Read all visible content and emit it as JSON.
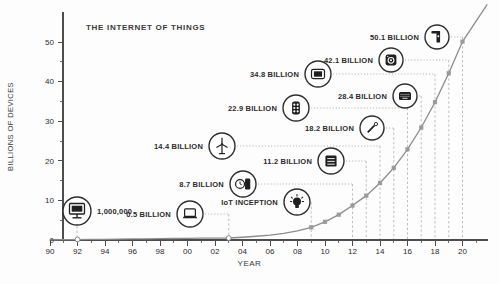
{
  "chart_data": {
    "type": "line",
    "title": "THE INTERNET OF THINGS",
    "xlabel": "YEAR",
    "ylabel": "BILLIONS OF DEVICES",
    "x_tick_years": [
      1990,
      1992,
      1994,
      1996,
      1998,
      2000,
      2002,
      2004,
      2006,
      2008,
      2010,
      2012,
      2014,
      2016,
      2018,
      2020
    ],
    "x_tick_labels": [
      "90",
      "92",
      "94",
      "96",
      "98",
      "00",
      "02",
      "04",
      "06",
      "08",
      "10",
      "12",
      "14",
      "16",
      "18",
      "20"
    ],
    "x_minor_years": [
      1991,
      1993,
      1995,
      1997,
      1999,
      2001,
      2003,
      2005,
      2007,
      2009,
      2011,
      2013,
      2015,
      2017,
      2019,
      2021
    ],
    "y_ticks": [
      0,
      10,
      20,
      30,
      40,
      50
    ],
    "y_minor_ticks": [
      5,
      15,
      25,
      35,
      45
    ],
    "xlim": [
      1990,
      2021.8
    ],
    "ylim": [
      0,
      59
    ],
    "grid": "dashed verticals at annotated years only",
    "legend": "none",
    "series": [
      {
        "name": "connected devices (billions)",
        "points": [
          [
            1990,
            0.05
          ],
          [
            1991,
            0.08
          ],
          [
            1992,
            0.1
          ],
          [
            1993,
            0.14
          ],
          [
            1994,
            0.18
          ],
          [
            1995,
            0.22
          ],
          [
            1996,
            0.26
          ],
          [
            1997,
            0.3
          ],
          [
            1998,
            0.34
          ],
          [
            1999,
            0.38
          ],
          [
            2000,
            0.42
          ],
          [
            2001,
            0.45
          ],
          [
            2002,
            0.48
          ],
          [
            2003,
            0.5
          ],
          [
            2004,
            0.7
          ],
          [
            2005,
            0.95
          ],
          [
            2006,
            1.25
          ],
          [
            2007,
            1.65
          ],
          [
            2008,
            2.3
          ],
          [
            2009,
            3.2
          ],
          [
            2010,
            4.6
          ],
          [
            2011,
            6.4
          ],
          [
            2012,
            8.7
          ],
          [
            2013,
            11.2
          ],
          [
            2014,
            14.4
          ],
          [
            2015,
            18.2
          ],
          [
            2016,
            22.9
          ],
          [
            2017,
            28.4
          ],
          [
            2018,
            34.8
          ],
          [
            2019,
            42.1
          ],
          [
            2020,
            50.1
          ],
          [
            2021.8,
            59.5
          ]
        ]
      }
    ],
    "marker_square_years": [
      2009,
      2010,
      2011,
      2012,
      2013,
      2014,
      2015,
      2016,
      2017,
      2018,
      2019,
      2020
    ],
    "annotations": [
      {
        "label": "1,000,000",
        "icon": "desktop-computer-icon",
        "year": 1992,
        "value": 0.001,
        "marker": "circle",
        "connector": "vertical",
        "icon_pos": [
          77,
          211
        ],
        "icon_r": 14,
        "label_side": "right"
      },
      {
        "label": "0.5 BILLION",
        "icon": "laptop-icon",
        "year": 2003,
        "value": 0.5,
        "marker": "circle",
        "connector": "elbow",
        "icon_pos": [
          190,
          214
        ],
        "icon_r": 13,
        "label_side": "left"
      },
      {
        "label": "IoT INCEPTION",
        "icon": "lightbulb-icon",
        "year": 2009,
        "value": null,
        "marker": "none",
        "connector": "elbow",
        "icon_pos": [
          297,
          202
        ],
        "icon_r": 13,
        "label_side": "left"
      },
      {
        "label": "8.7 BILLION",
        "icon": "smartwatch-icon",
        "year": 2012,
        "value": 8.7,
        "marker": "square",
        "connector": "elbow",
        "icon_pos": [
          243,
          184
        ],
        "icon_r": 13,
        "label_side": "left"
      },
      {
        "label": "11.2 BILLION",
        "icon": "server-icon",
        "year": 2013,
        "value": 11.2,
        "marker": "square",
        "connector": "elbow",
        "icon_pos": [
          331,
          161
        ],
        "icon_r": 13,
        "label_side": "left"
      },
      {
        "label": "14.4 BILLION",
        "icon": "wind-turbine-icon",
        "year": 2014,
        "value": 14.4,
        "marker": "square",
        "connector": "elbow",
        "icon_pos": [
          222,
          146
        ],
        "icon_r": 13,
        "label_side": "left"
      },
      {
        "label": "18.2 BILLION",
        "icon": "pen-icon",
        "year": 2015,
        "value": 18.2,
        "marker": "square",
        "connector": "elbow",
        "icon_pos": [
          372,
          128
        ],
        "icon_r": 12,
        "label_side": "left"
      },
      {
        "label": "22.9 BILLION",
        "icon": "traffic-light-icon",
        "year": 2016,
        "value": 22.9,
        "marker": "square",
        "connector": "elbow",
        "icon_pos": [
          296,
          108
        ],
        "icon_r": 13,
        "label_side": "left"
      },
      {
        "label": "28.4 BILLION",
        "icon": "keyboard-icon",
        "year": 2017,
        "value": 28.4,
        "marker": "square",
        "connector": "elbow",
        "icon_pos": [
          405,
          96
        ],
        "icon_r": 12,
        "label_side": "left"
      },
      {
        "label": "34.8 BILLION",
        "icon": "tablet-icon",
        "year": 2018,
        "value": 34.8,
        "marker": "square",
        "connector": "elbow",
        "icon_pos": [
          318,
          74
        ],
        "icon_r": 13,
        "label_side": "left"
      },
      {
        "label": "42.1 BILLION",
        "icon": "washing-machine-icon",
        "year": 2019,
        "value": 42.1,
        "marker": "square",
        "connector": "elbow",
        "icon_pos": [
          391,
          60
        ],
        "icon_r": 12,
        "label_side": "left"
      },
      {
        "label": "50.1 BILLION",
        "icon": "door-lock-icon",
        "year": 2020,
        "value": 50.1,
        "marker": "square",
        "connector": "elbow",
        "icon_pos": [
          437,
          37
        ],
        "icon_r": 12,
        "label_side": "left"
      }
    ],
    "colors": {
      "curve": "#8c8c8c",
      "marker": "#9a9a9a",
      "dashed": "#b8b8b8",
      "dotted": "#adadad",
      "axis": "#4d4d4d",
      "text": "#2b2b2b",
      "icon": "#1f1f1f",
      "background": "#fdfdfd"
    }
  }
}
